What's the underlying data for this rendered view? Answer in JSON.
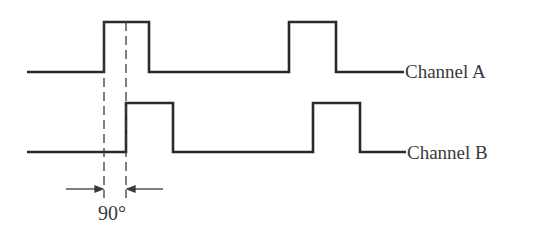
{
  "diagram": {
    "type": "quadrature-encoder-timing",
    "channels": [
      {
        "name": "Channel A",
        "baseline_y": 72,
        "high_y": 22,
        "x_start": 27,
        "x_end": 404,
        "pulses": [
          [
            104,
            149
          ],
          [
            289,
            336
          ]
        ]
      },
      {
        "name": "Channel B",
        "baseline_y": 152,
        "high_y": 103,
        "x_start": 27,
        "x_end": 406,
        "pulses": [
          [
            126,
            173
          ],
          [
            313,
            360
          ]
        ]
      }
    ],
    "phase_marker": {
      "label": "90°",
      "dashed_x": [
        104,
        126
      ],
      "dashed_y": [
        22,
        198
      ],
      "arrow_y": 189
    },
    "colors": {
      "waveform": "#2a2a2a",
      "text": "#3a3a3a",
      "background": "#ffffff"
    }
  }
}
